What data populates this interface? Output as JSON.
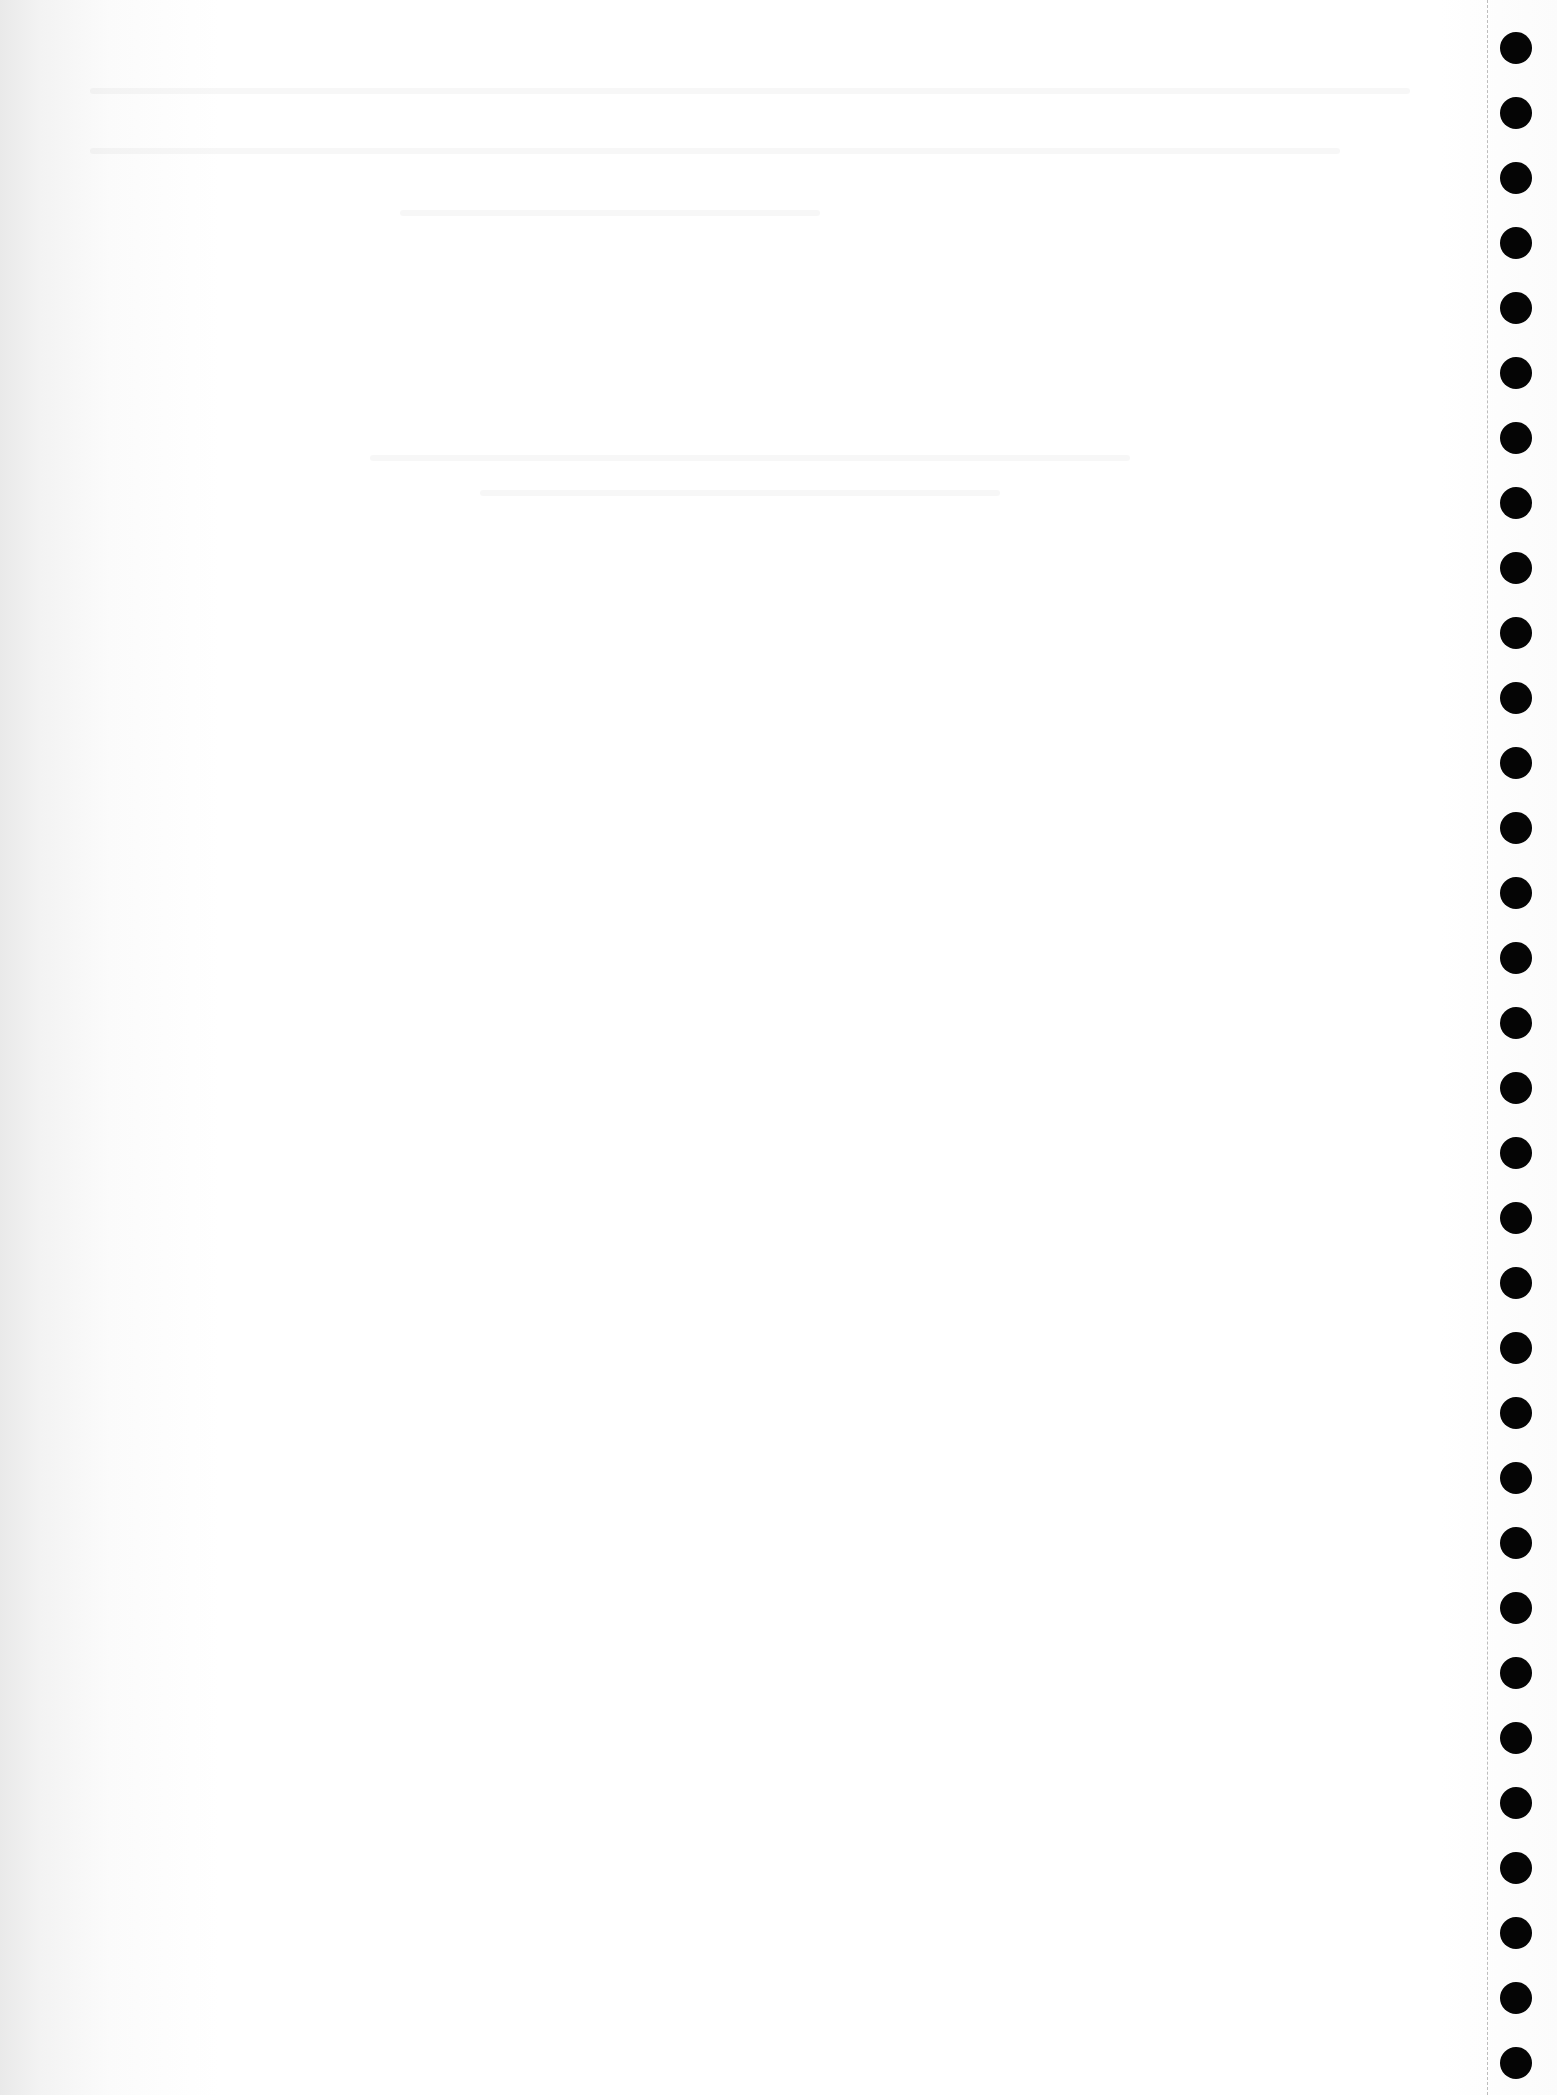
{
  "page": {
    "type": "continuous-feed paper scan",
    "background_color": "#ffffff",
    "text_content": []
  },
  "tractor_feed": {
    "hole_color": "#050505",
    "perforation_color": "#bdbdbd",
    "hole_count": 32,
    "first_hole_center_y": 48,
    "hole_spacing": 65,
    "hole_diameter": 32
  }
}
